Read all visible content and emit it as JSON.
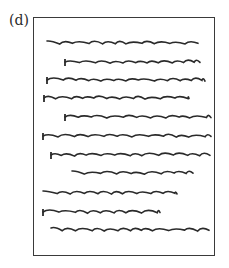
{
  "figure": {
    "label": "(d)",
    "stroke_color": "#2a2a2a",
    "frame_color": "#3a3a3a",
    "lines": [
      {
        "y": 43,
        "x1": 47,
        "x2": 198,
        "tick": false
      },
      {
        "y": 62,
        "x1": 65,
        "x2": 200,
        "tick": true
      },
      {
        "y": 80,
        "x1": 47,
        "x2": 205,
        "tick": true
      },
      {
        "y": 98,
        "x1": 44,
        "x2": 189,
        "tick": true
      },
      {
        "y": 117,
        "x1": 65,
        "x2": 211,
        "tick": true
      },
      {
        "y": 136,
        "x1": 43,
        "x2": 211,
        "tick": true
      },
      {
        "y": 155,
        "x1": 51,
        "x2": 210,
        "tick": true
      },
      {
        "y": 173,
        "x1": 72,
        "x2": 193,
        "tick": false
      },
      {
        "y": 193,
        "x1": 43,
        "x2": 177,
        "tick": false
      },
      {
        "y": 212,
        "x1": 43,
        "x2": 160,
        "tick": true
      },
      {
        "y": 230,
        "x1": 51,
        "x2": 209,
        "tick": false
      }
    ]
  }
}
